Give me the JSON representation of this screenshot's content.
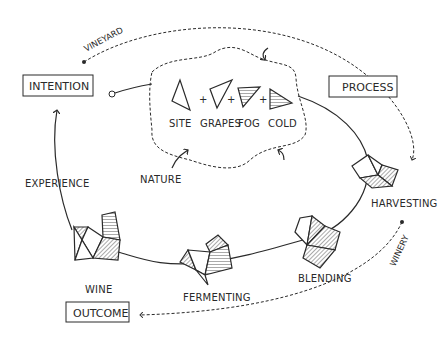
{
  "nodes": {
    "intention": "INTENTION",
    "process": "PROCESS",
    "outcome": "OUTCOME"
  },
  "nature": {
    "label": "NATURE",
    "factors": [
      {
        "label": "SITE",
        "fill": "none"
      },
      {
        "label": "GRAPES",
        "fill": "none"
      },
      {
        "label": "FOG",
        "fill": "horizontal-hatch"
      },
      {
        "label": "COLD",
        "fill": "horizontal-hatch"
      }
    ],
    "operator": "+"
  },
  "paths": {
    "vineyard": "VINEYARD",
    "winery": "WINERY"
  },
  "stages": [
    {
      "label": "HARVESTING"
    },
    {
      "label": "BLENDING"
    },
    {
      "label": "FERMENTING"
    },
    {
      "label": "WINE"
    }
  ],
  "feedback": {
    "label": "EXPERIENCE"
  }
}
